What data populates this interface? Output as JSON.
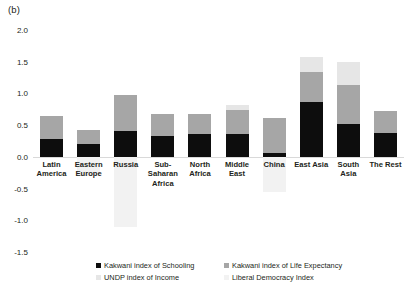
{
  "panel": {
    "label": "(b)"
  },
  "chart_data": {
    "type": "bar",
    "subtype": "stacked-bar-with-negatives",
    "title": "",
    "xlabel": "",
    "ylabel": "",
    "ylim": [
      -1.5,
      2.0
    ],
    "ytick_values": [
      2.0,
      1.5,
      1.0,
      0.5,
      0.0,
      -0.5,
      -1.0,
      -1.5
    ],
    "ytick_labels": [
      "2.0",
      "1.5",
      "1.0",
      "0.5",
      "0.0",
      "-0.5",
      "-1.0",
      "-1.5"
    ],
    "grid": false,
    "zero_line": true,
    "legend_position": "bottom",
    "categories": [
      "Latin America",
      "Eastern Europe",
      "Russia",
      "Sub-Saharan Africa",
      "North Africa",
      "Middle East",
      "China",
      "East Asia",
      "South Asia",
      "The Rest"
    ],
    "series": [
      {
        "name": "Kakwani index of Schooling",
        "color": "#0d0d0d",
        "values": [
          0.28,
          0.2,
          0.4,
          0.33,
          0.36,
          0.36,
          0.06,
          0.86,
          0.52,
          0.38
        ]
      },
      {
        "name": "Kakwani index of Life Expectancy",
        "color": "#a6a6a6",
        "values": [
          0.37,
          0.22,
          0.58,
          0.35,
          0.31,
          0.38,
          0.56,
          0.47,
          0.61,
          0.34
        ]
      },
      {
        "name": "UNDP index of Income",
        "color": "#e6e6e6",
        "values": [
          0.0,
          0.0,
          0.0,
          0.0,
          0.0,
          0.08,
          0.0,
          0.25,
          0.37,
          0.0
        ]
      },
      {
        "name": "Liberal Democracy Index",
        "color": "#f2f2f2",
        "values": [
          0.0,
          -0.3,
          -1.1,
          0.0,
          0.0,
          0.0,
          -0.55,
          0.0,
          0.0,
          0.0
        ]
      }
    ],
    "bar_tops": [
      0.65,
      0.42,
      0.98,
      0.68,
      0.67,
      0.82,
      0.62,
      1.58,
      1.5,
      0.72
    ],
    "bar_bottoms": [
      0.0,
      -0.3,
      -1.1,
      0.0,
      0.0,
      0.0,
      -0.55,
      0.0,
      0.0,
      0.0
    ]
  },
  "legend": {
    "items": [
      {
        "label": "Kakwani index of Schooling",
        "swatch": "sw-school"
      },
      {
        "label": "Kakwani index of Life Expectancy",
        "swatch": "sw-life"
      },
      {
        "label": "UNDP index of Income",
        "swatch": "sw-income"
      },
      {
        "label": "Liberal Democracy Index",
        "swatch": "sw-demo"
      }
    ]
  }
}
